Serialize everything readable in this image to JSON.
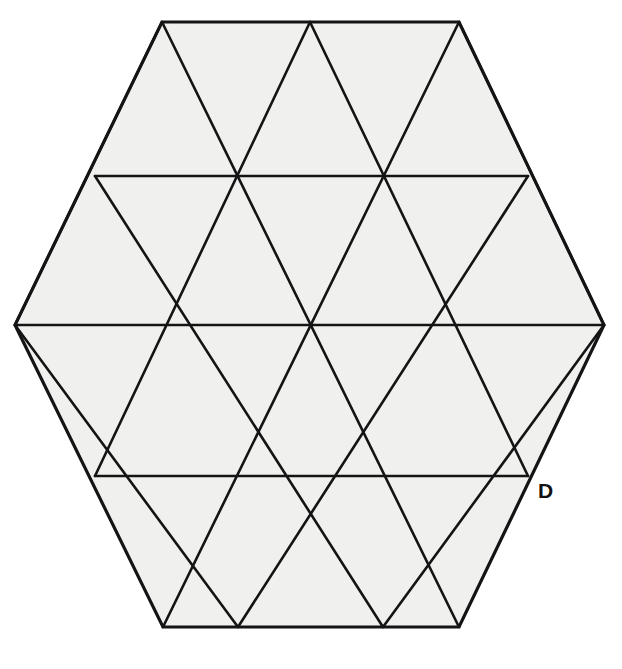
{
  "figure": {
    "kind": "geometric-diagram",
    "shape_name": "regular-hexagon",
    "background_color": "#ffffff",
    "fill_color": "#f0f0ef",
    "stroke_color": "#141414",
    "outer_stroke_width": 3.2,
    "inner_stroke_width": 2.6,
    "canvas": {
      "width": 622,
      "height": 669
    },
    "hexagon_vertices": [
      {
        "name": "top-left",
        "x": 162,
        "y": 22
      },
      {
        "name": "top-right",
        "x": 459,
        "y": 22
      },
      {
        "name": "right",
        "x": 604,
        "y": 325
      },
      {
        "name": "bottom-right",
        "x": 459,
        "y": 627
      },
      {
        "name": "bottom-left",
        "x": 163,
        "y": 627
      },
      {
        "name": "left",
        "x": 15,
        "y": 325
      }
    ],
    "horizontal_grid_lines": [
      {
        "y": 176,
        "x1": 95,
        "x2": 528
      },
      {
        "y": 325,
        "x1": 15,
        "x2": 604
      },
      {
        "y": 476,
        "x1": 95,
        "x2": 528
      }
    ],
    "diagonal_lines_down_right": [
      {
        "x1": 162,
        "y1": 22,
        "x2": 459,
        "y2": 627
      },
      {
        "x1": 310,
        "y1": 22,
        "x2": 528,
        "y2": 476
      },
      {
        "x1": 459,
        "y1": 22,
        "x2": 604,
        "y2": 325
      },
      {
        "x1": 95,
        "y1": 176,
        "x2": 383,
        "y2": 627
      },
      {
        "x1": 15,
        "y1": 325,
        "x2": 238,
        "y2": 627
      }
    ],
    "diagonal_lines_down_left": [
      {
        "x1": 459,
        "y1": 22,
        "x2": 163,
        "y2": 627
      },
      {
        "x1": 310,
        "y1": 22,
        "x2": 95,
        "y2": 476
      },
      {
        "x1": 162,
        "y1": 22,
        "x2": 15,
        "y2": 325
      },
      {
        "x1": 528,
        "y1": 176,
        "x2": 238,
        "y2": 627
      },
      {
        "x1": 604,
        "y1": 325,
        "x2": 383,
        "y2": 627
      }
    ],
    "triangle_count": 24,
    "labels": [
      {
        "id": "D",
        "text": "D",
        "x": 538,
        "y": 480,
        "anchor_vertex": {
          "x": 528,
          "y": 476
        },
        "style": "bold"
      }
    ]
  }
}
